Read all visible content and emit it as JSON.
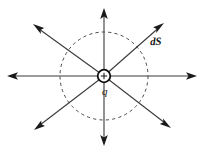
{
  "figure": {
    "kind": "physics-diagram",
    "background_color": "#ffffff",
    "line_color": "#3a3a3a",
    "dash_color": "#4a4a4a",
    "ink_color": "#1a1a1a",
    "labels": {
      "charge": "q",
      "surface_element": "dS",
      "charge_sign": "+"
    },
    "geometry": {
      "center_x": 104,
      "center_y": 76,
      "gaussian_radius": 44,
      "charge_radius": 6.5,
      "field_line_count": 8
    },
    "field_lines": [
      {
        "name": "east",
        "angle_deg": 0,
        "tip_x": 197,
        "tip_y": 76
      },
      {
        "name": "northeast",
        "angle_deg": 45,
        "tip_x": 164,
        "tip_y": 23
      },
      {
        "name": "north",
        "angle_deg": 90,
        "tip_x": 104,
        "tip_y": 8
      },
      {
        "name": "northwest",
        "angle_deg": 135,
        "tip_x": 33,
        "tip_y": 24
      },
      {
        "name": "west",
        "angle_deg": 180,
        "tip_x": 7,
        "tip_y": 76
      },
      {
        "name": "southwest",
        "angle_deg": 225,
        "tip_x": 34,
        "tip_y": 130
      },
      {
        "name": "south",
        "angle_deg": 270,
        "tip_x": 104,
        "tip_y": 146
      },
      {
        "name": "southeast",
        "angle_deg": 315,
        "tip_x": 171,
        "tip_y": 128
      }
    ]
  }
}
